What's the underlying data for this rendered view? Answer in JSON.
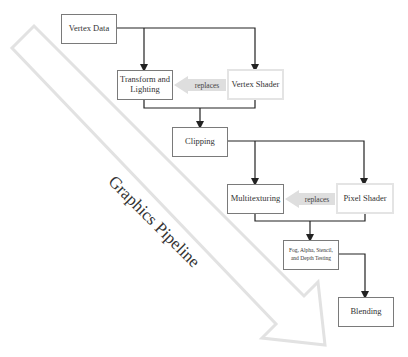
{
  "diagram": {
    "pipeline_label": "Graphics Pipeline",
    "nodes": {
      "vertex_data": "Vertex Data",
      "transform_lighting": "Transform and Lighting",
      "vertex_shader": "Vertex Shader",
      "clipping": "Clipping",
      "multitexturing": "Multitexturing",
      "pixel_shader": "Pixel Shader",
      "fog_testing": "Fog, Alpha, Stencil, and Depth Testing",
      "blending": "Blending"
    },
    "replaces_labels": [
      "replaces",
      "replaces"
    ],
    "colors": {
      "box_border": "#7a7a7a",
      "shader_border": "#e4e4e4",
      "connector": "#222222",
      "replaces_arrow": "#dddddd",
      "pipeline_arrow_outline": "#e2e2e2"
    }
  }
}
